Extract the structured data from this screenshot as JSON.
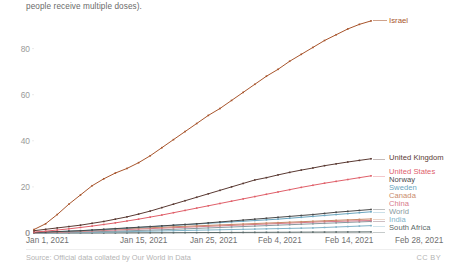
{
  "header": {
    "subtitle_line": "people receive multiple doses)."
  },
  "footer": {
    "source": "Source: Official data collated by Our World in Data",
    "license": "CC BY"
  },
  "chart_data": {
    "type": "line",
    "title": "",
    "subtitle": "people receive multiple doses).",
    "xlabel": "",
    "ylabel": "",
    "ylim": [
      0,
      95
    ],
    "yticks": [
      0,
      20,
      40,
      60,
      80
    ],
    "ytick_labels": [
      "0",
      "20",
      "40",
      "60",
      "80"
    ],
    "grid": false,
    "legend_position": "right",
    "x_range_days": [
      0,
      58
    ],
    "x": [
      0,
      2,
      4,
      6,
      8,
      10,
      12,
      14,
      16,
      18,
      20,
      22,
      24,
      26,
      28,
      30,
      32,
      34,
      36,
      38,
      40,
      42,
      44,
      46,
      48,
      50,
      52,
      54,
      56,
      58
    ],
    "xtick_positions_days": [
      0,
      14,
      24,
      34,
      44,
      58
    ],
    "xtick_labels": [
      "Jan 1, 2021",
      "Jan 15, 2021",
      "Jan 25, 2021",
      "Feb 4, 2021",
      "Feb 14, 2021",
      "Feb 28, 2021"
    ],
    "series": [
      {
        "name": "Israel",
        "color": "#a8552c",
        "label_visible": "Israel",
        "values": [
          1.5,
          4.0,
          8.0,
          12.5,
          16.5,
          20.5,
          23.5,
          26.0,
          28.0,
          30.5,
          33.5,
          37.0,
          40.5,
          44.0,
          47.5,
          51.0,
          54.0,
          57.5,
          61.0,
          64.5,
          68.0,
          71.0,
          74.5,
          77.5,
          80.5,
          83.5,
          86.0,
          88.5,
          90.5,
          92.0
        ]
      },
      {
        "name": "United Kingdom",
        "color": "#5a3a33",
        "label_visible": "United Kingdom",
        "values": [
          1.0,
          1.6,
          2.2,
          2.8,
          3.4,
          4.2,
          5.0,
          6.0,
          7.0,
          8.2,
          9.5,
          11.0,
          12.5,
          14.0,
          15.5,
          17.0,
          18.5,
          20.0,
          21.5,
          23.0,
          24.0,
          25.2,
          26.3,
          27.3,
          28.2,
          29.2,
          30.0,
          30.8,
          31.5,
          32.2
        ]
      },
      {
        "name": "United States",
        "color": "#e0606a",
        "label_visible": "United States",
        "values": [
          0.4,
          0.8,
          1.3,
          1.8,
          2.4,
          3.0,
          3.7,
          4.4,
          5.2,
          6.0,
          6.9,
          7.8,
          8.8,
          9.8,
          10.8,
          11.8,
          12.8,
          13.8,
          14.8,
          15.8,
          16.8,
          17.8,
          18.8,
          19.8,
          20.7,
          21.6,
          22.4,
          23.2,
          24.0,
          24.8
        ]
      },
      {
        "name": "Norway",
        "color": "#4a4a4a",
        "label_visible": "Norway",
        "values": [
          0.2,
          0.4,
          0.6,
          0.8,
          1.0,
          1.3,
          1.6,
          1.9,
          2.2,
          2.5,
          2.8,
          3.1,
          3.4,
          3.7,
          4.0,
          4.4,
          4.8,
          5.2,
          5.6,
          6.0,
          6.4,
          6.8,
          7.2,
          7.6,
          8.0,
          8.5,
          9.0,
          9.4,
          9.8,
          10.2
        ]
      },
      {
        "name": "Sweden",
        "color": "#6aa6c0",
        "label_visible": "Sweden",
        "values": [
          0.2,
          0.4,
          0.6,
          0.8,
          1.0,
          1.2,
          1.5,
          1.8,
          2.1,
          2.4,
          2.7,
          3.0,
          3.3,
          3.6,
          3.9,
          4.2,
          4.5,
          4.8,
          5.1,
          5.4,
          5.7,
          6.0,
          6.4,
          6.8,
          7.2,
          7.6,
          8.0,
          8.4,
          8.8,
          9.2
        ]
      },
      {
        "name": "Canada",
        "color": "#c98b6a",
        "label_visible": "Canada",
        "values": [
          0.1,
          0.3,
          0.5,
          0.7,
          0.9,
          1.1,
          1.4,
          1.7,
          1.9,
          2.1,
          2.3,
          2.5,
          2.7,
          2.9,
          3.1,
          3.3,
          3.5,
          3.7,
          3.9,
          4.1,
          4.3,
          4.5,
          4.7,
          4.9,
          5.1,
          5.3,
          5.5,
          5.7,
          5.9,
          6.1
        ]
      },
      {
        "name": "China",
        "color": "#d87a8a",
        "label_visible": "China",
        "values": [
          0.1,
          0.2,
          0.3,
          0.5,
          0.7,
          0.9,
          1.1,
          1.3,
          1.5,
          1.7,
          1.9,
          2.1,
          2.3,
          2.5,
          2.7,
          2.9,
          3.1,
          3.3,
          3.5,
          3.7,
          3.9,
          4.1,
          4.3,
          4.5,
          4.7,
          4.9,
          5.0,
          5.2,
          5.3,
          5.4
        ]
      },
      {
        "name": "World",
        "color": "#8a9aa0",
        "label_visible": "World",
        "values": [
          0.05,
          0.1,
          0.2,
          0.3,
          0.4,
          0.5,
          0.65,
          0.8,
          0.95,
          1.1,
          1.25,
          1.4,
          1.6,
          1.8,
          2.0,
          2.2,
          2.4,
          2.6,
          2.8,
          3.0,
          3.2,
          3.4,
          3.6,
          3.8,
          4.0,
          4.2,
          4.4,
          4.6,
          4.8,
          5.0
        ]
      },
      {
        "name": "India",
        "color": "#7fb3c8",
        "label_visible": "India",
        "values": [
          0.0,
          0.05,
          0.1,
          0.15,
          0.2,
          0.3,
          0.4,
          0.5,
          0.6,
          0.7,
          0.8,
          0.9,
          1.0,
          1.1,
          1.2,
          1.3,
          1.4,
          1.5,
          1.6,
          1.7,
          1.8,
          1.9,
          2.0,
          2.1,
          2.2,
          2.4,
          2.6,
          2.8,
          3.0,
          3.2
        ]
      },
      {
        "name": "South Africa",
        "color": "#5b6b6a",
        "label_visible": "South Africa",
        "values": [
          0.0,
          0.0,
          0.0,
          0.0,
          0.0,
          0.0,
          0.02,
          0.04,
          0.06,
          0.08,
          0.1,
          0.12,
          0.14,
          0.16,
          0.18,
          0.2,
          0.22,
          0.24,
          0.26,
          0.28,
          0.3,
          0.32,
          0.34,
          0.36,
          0.38,
          0.4,
          0.42,
          0.44,
          0.46,
          0.48
        ]
      }
    ],
    "annotations": [
      {
        "text": "Israel",
        "series": "Israel",
        "color": "#a8552c"
      }
    ]
  }
}
